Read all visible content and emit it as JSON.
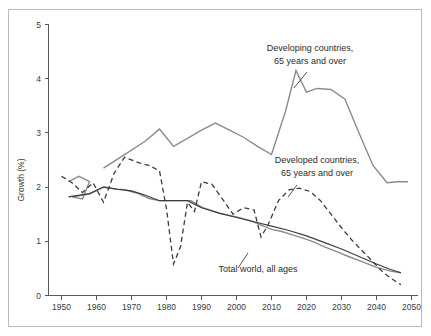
{
  "chart_data": {
    "type": "line",
    "title": "",
    "xlabel": "",
    "ylabel": "Growth (%)",
    "xlim": [
      1950,
      2050
    ],
    "ylim": [
      0,
      5
    ],
    "xticks": [
      1950,
      1960,
      1970,
      1980,
      1990,
      2000,
      2010,
      2020,
      2030,
      2040,
      2050
    ],
    "yticks": [
      0,
      1,
      2,
      3,
      4,
      5
    ],
    "grid": false,
    "legend_position": "inline-annotations",
    "series": [
      {
        "name": "Developing countries, 65 years and over",
        "style": "solid",
        "color": "#8b8b8b",
        "x": [
          1952,
          1955,
          1958,
          1956,
          1953,
          1958,
          1962,
          1966,
          1968,
          1972,
          1975,
          1978,
          1982,
          1987,
          1990,
          1995,
          2000,
          2004,
          2007,
          2010,
          2013,
          2016,
          2019,
          2022,
          2025,
          2029,
          2032,
          2036,
          2040,
          2044,
          2047
        ],
        "y": [
          2.1,
          2.2,
          2.1,
          1.78,
          1.82,
          1.87,
          2.0,
          1.96,
          1.95,
          1.88,
          1.79,
          1.75,
          1.75,
          1.75,
          1.63,
          1.52,
          1.45,
          1.38,
          1.3,
          1.22,
          1.18,
          1.12,
          1.06,
          0.99,
          0.9,
          0.8,
          0.72,
          0.62,
          0.52,
          0.45,
          0.42
        ]
      },
      {
        "name": "Developing countries curve (gray upper)",
        "style": "solid",
        "color": "#8b8b8b",
        "x": [
          1962,
          1968,
          1974,
          1978,
          1982,
          1986,
          1990,
          1994,
          1998,
          2002,
          2006,
          2010,
          2014,
          2017,
          2020,
          2023,
          2027,
          2031,
          2035,
          2039,
          2043,
          2046,
          2049
        ],
        "y": [
          2.35,
          2.6,
          2.85,
          3.07,
          2.75,
          2.9,
          3.05,
          3.18,
          3.05,
          2.92,
          2.75,
          2.6,
          3.4,
          4.15,
          3.75,
          3.82,
          3.8,
          3.62,
          3.0,
          2.4,
          2.08,
          2.1,
          2.1
        ]
      },
      {
        "name": "Developed countries, 65 years and over",
        "style": "dashed",
        "color": "#3c3c3c",
        "x": [
          1950,
          1953,
          1956,
          1959,
          1962,
          1965,
          1968,
          1972,
          1975,
          1978,
          1980,
          1982,
          1984,
          1986,
          1988,
          1990,
          1993,
          1996,
          1999,
          2002,
          2005,
          2007,
          2009,
          2012,
          2015,
          2018,
          2021,
          2024,
          2027,
          2030,
          2033,
          2036,
          2039,
          2042,
          2045,
          2047
        ],
        "y": [
          2.2,
          2.08,
          1.9,
          2.08,
          1.72,
          2.25,
          2.55,
          2.45,
          2.4,
          2.3,
          1.6,
          0.58,
          0.9,
          1.72,
          1.55,
          2.1,
          2.05,
          1.78,
          1.5,
          1.62,
          1.58,
          1.08,
          1.3,
          1.75,
          1.95,
          1.98,
          1.92,
          1.75,
          1.5,
          1.25,
          1.02,
          0.82,
          0.62,
          0.42,
          0.28,
          0.2
        ]
      },
      {
        "name": "Total world, all ages",
        "style": "solid",
        "color": "#3c3c3c",
        "x": [
          1952,
          1958,
          1962,
          1966,
          1970,
          1974,
          1978,
          1982,
          1986,
          1990,
          1995,
          2000,
          2005,
          2010,
          2015,
          2020,
          2025,
          2030,
          2035,
          2040,
          2044,
          2047
        ],
        "y": [
          1.82,
          1.88,
          2.0,
          1.96,
          1.93,
          1.85,
          1.75,
          1.75,
          1.75,
          1.62,
          1.52,
          1.44,
          1.36,
          1.28,
          1.2,
          1.1,
          0.98,
          0.86,
          0.72,
          0.58,
          0.48,
          0.42
        ]
      }
    ],
    "annotations": [
      {
        "id": "developing",
        "line1": "Developing countries,",
        "line2": "65 years and over"
      },
      {
        "id": "developed",
        "line1": "Developed countries,",
        "line2": "65 years and over"
      },
      {
        "id": "world",
        "line1": "Total world, all ages",
        "line2": ""
      }
    ]
  },
  "axis": {
    "ylabel": "Growth (%)",
    "ytick_labels": [
      "0",
      "1",
      "2",
      "3",
      "4",
      "5"
    ],
    "xtick_labels": [
      "1950",
      "1960",
      "1970",
      "1980",
      "1990",
      "2000",
      "2010",
      "2020",
      "2030",
      "2040",
      "2050"
    ]
  }
}
